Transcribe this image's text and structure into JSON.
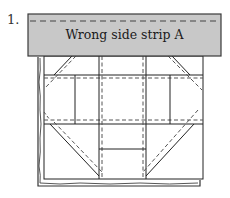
{
  "figure": {
    "step_number": "1.",
    "strip": {
      "label": "Wrong side strip A",
      "fill": "#c8c8c8",
      "stroke": "#444444"
    },
    "block": {
      "description": "Quilt block with seam allowances shown as dashed stitching lines",
      "stroke": "#222222",
      "dash_stroke": "#555555"
    }
  }
}
